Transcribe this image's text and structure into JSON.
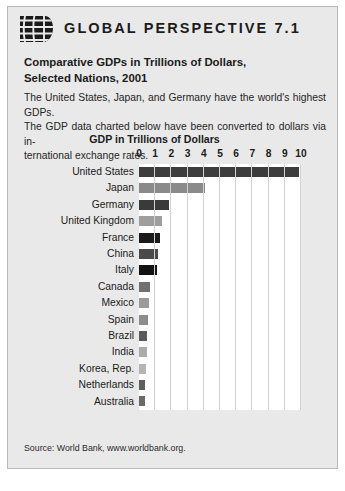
{
  "banner": {
    "title": "GLOBAL PERSPECTIVE 7.1",
    "logo_icon": "globe-icon"
  },
  "subtitle_line1": "Comparative GDPs in Trillions of Dollars,",
  "subtitle_line2": "Selected Nations, 2001",
  "blurb_line1": "The United States, Japan, and Germany have the world's highest GDPs.",
  "blurb_line2": "The GDP data charted below have been converted to dollars via in-",
  "blurb_line3": "ternational exchange rates.",
  "source": "Source: World Bank, www.worldbank.org.",
  "colors": {
    "panel_background": "#e9e9e9",
    "panel_border": "#b9b9b9",
    "plot_background": "#ffffff",
    "gridline": "#d2d2d2",
    "text": "#1b1b1b"
  },
  "chart_data": {
    "type": "bar",
    "orientation": "horizontal",
    "title": "GDP in Trillions of Dollars",
    "xlabel": "GDP in Trillions of Dollars",
    "ylabel": "",
    "xlim": [
      0,
      10
    ],
    "xticks": [
      0,
      1,
      2,
      3,
      4,
      5,
      6,
      7,
      8,
      9,
      10
    ],
    "xtick_labels": [
      "0",
      "1",
      "2",
      "3",
      "4",
      "5",
      "6",
      "7",
      "8",
      "9",
      "10"
    ],
    "grid": true,
    "legend": false,
    "categories": [
      "United States",
      "Japan",
      "Germany",
      "United Kingdom",
      "France",
      "China",
      "Italy",
      "Canada",
      "Mexico",
      "Spain",
      "Brazil",
      "India",
      "Korea, Rep.",
      "Netherlands",
      "Australia"
    ],
    "values": [
      9.9,
      4.1,
      1.85,
      1.4,
      1.3,
      1.2,
      1.1,
      0.7,
      0.62,
      0.58,
      0.5,
      0.48,
      0.42,
      0.38,
      0.37
    ],
    "bar_colors": [
      "#3d3d3d",
      "#8a8a8a",
      "#3a3a3a",
      "#9e9e9e",
      "#1a1a1a",
      "#4a4a4a",
      "#121212",
      "#707070",
      "#9a9a9a",
      "#8c8c8c",
      "#5a5a5a",
      "#ababab",
      "#b5b5b5",
      "#5e5e5e",
      "#6a6a6a"
    ]
  }
}
